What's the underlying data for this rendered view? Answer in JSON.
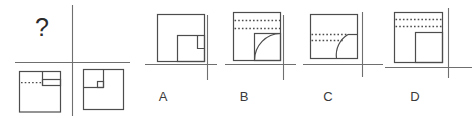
{
  "question": {
    "mark": "?"
  },
  "options": [
    {
      "label": "A",
      "description": "square with inner bottom-right square and small notch rectangle hanging from its top edge at the right side"
    },
    {
      "label": "B",
      "description": "square with two dotted horizontal lines near the top and an inner bottom-right square containing a quarter-circle arc"
    },
    {
      "label": "C",
      "description": "square with two dotted horizontal lines at mid height, a short solid segment to the right edge and a quarter-circle arc at the bottom-right"
    },
    {
      "label": "D",
      "description": "square with two dotted horizontal lines near the top and an inner bottom-right square"
    }
  ],
  "matrix": {
    "bottom_left_figure": "square with vertical segment from top edge, dotted line on its left and narrow rectangle to the right edge",
    "bottom_right_figure": "square with vertical and horizontal segments meeting at a junction marked by a small square"
  },
  "colors": {
    "background": "#ffffff",
    "figure_line": "#4d4d4d",
    "axis_line": "#6f6f6f",
    "text": "#3a3a3a"
  }
}
